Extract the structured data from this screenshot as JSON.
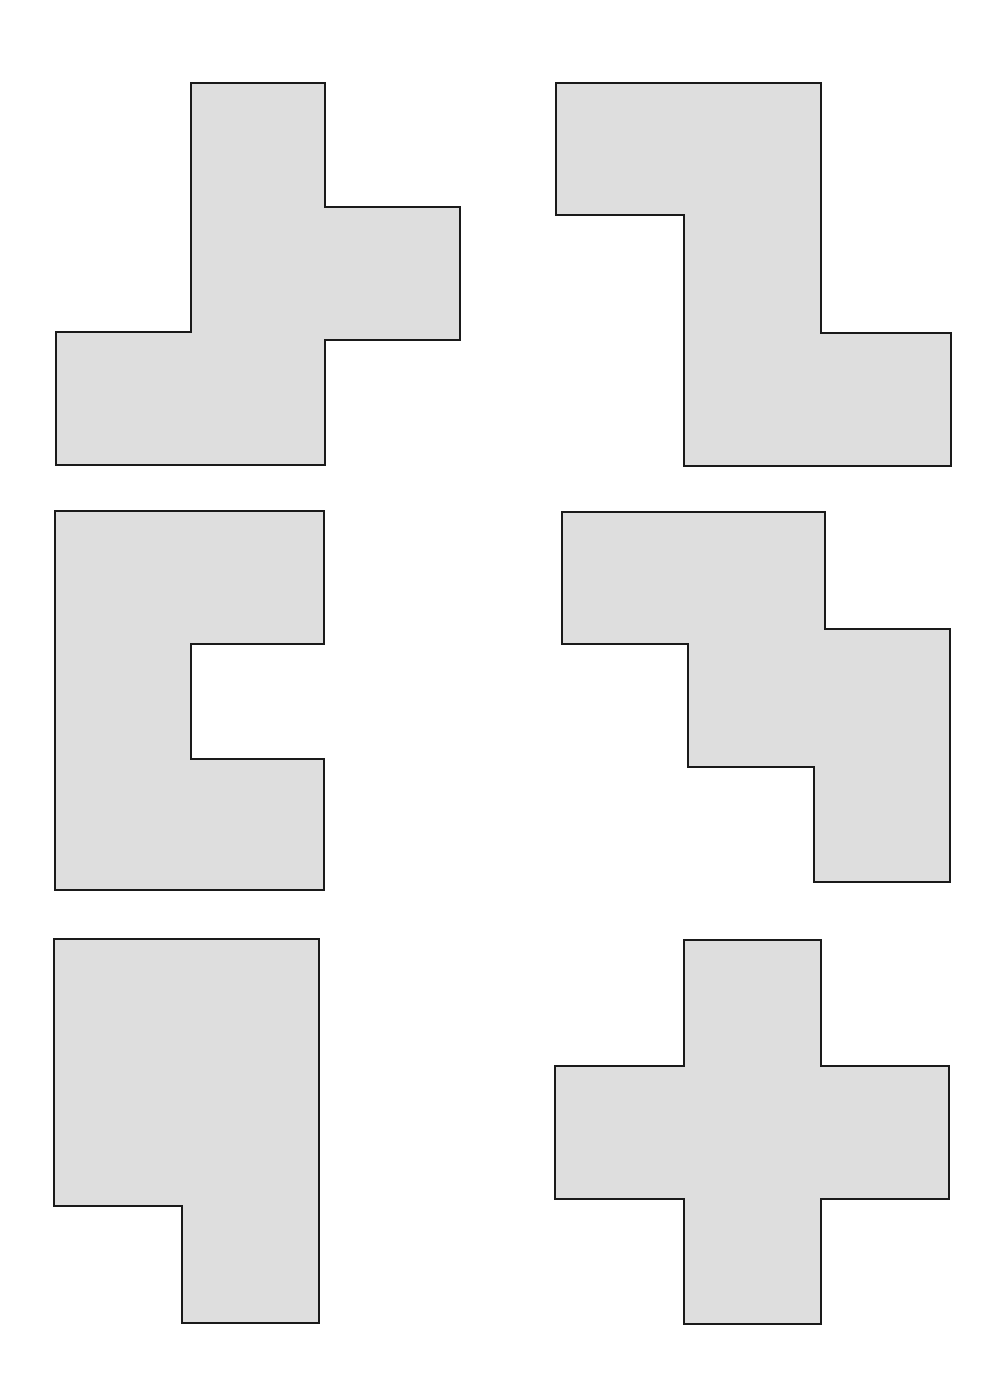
{
  "diagram": {
    "title": "",
    "background": "#ffffff",
    "fill_color": "#dedede",
    "stroke_color": "#1a1a1a",
    "stroke_width": 2,
    "shapes": [
      {
        "id": "shape-1",
        "kind": "F-pentomino",
        "position": "top-left",
        "points": "191,83 325,83 325,207 460,207 460,340 325,340 325,465 56,465 56,332 191,332"
      },
      {
        "id": "shape-2",
        "kind": "Z-pentomino",
        "position": "top-right",
        "points": "556,83 821,83 821,333 951,333 951,466 684,466 684,215 556,215"
      },
      {
        "id": "shape-3",
        "kind": "U-pentomino",
        "position": "middle-left",
        "points": "55,511 324,511 324,644 191,644 191,759 324,759 324,890 55,890"
      },
      {
        "id": "shape-4",
        "kind": "W-pentomino",
        "position": "middle-right",
        "points": "562,512 825,512 825,629 950,629 950,882 814,882 814,767 688,767 688,644 562,644"
      },
      {
        "id": "shape-5",
        "kind": "P-pentomino",
        "position": "bottom-left",
        "points": "54,939 319,939 319,1323 182,1323 182,1206 54,1206"
      },
      {
        "id": "shape-6",
        "kind": "X-pentomino",
        "position": "bottom-right",
        "points": "684,940 821,940 821,1066 949,1066 949,1199 821,1199 821,1324 684,1324 684,1199 555,1199 555,1066 684,1066"
      }
    ]
  }
}
